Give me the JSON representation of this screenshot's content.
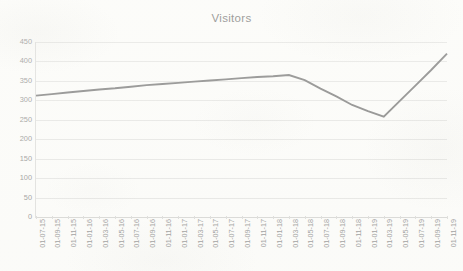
{
  "chart_data": {
    "type": "line",
    "title": "Visitors",
    "xlabel": "",
    "ylabel": "",
    "ylim": [
      0,
      450
    ],
    "yticks": [
      0,
      50,
      100,
      150,
      200,
      250,
      300,
      350,
      400,
      450
    ],
    "grid": true,
    "legend": false,
    "legend_position": "none",
    "line_color": "#737373",
    "categories": [
      "01-07-15",
      "01-09-15",
      "01-11-15",
      "01-01-16",
      "01-03-16",
      "01-05-16",
      "01-07-16",
      "01-09-16",
      "01-11-16",
      "01-01-17",
      "01-03-17",
      "01-05-17",
      "01-07-17",
      "01-09-17",
      "01-11-17",
      "01-01-18",
      "01-03-18",
      "01-05-18",
      "01-07-18",
      "01-09-18",
      "01-11-18",
      "01-01-19",
      "01-03-19",
      "01-05-19",
      "01-07-19",
      "01-09-19",
      "01-11-19"
    ],
    "values": [
      312,
      316,
      320,
      324,
      328,
      331,
      335,
      339,
      342,
      345,
      348,
      351,
      354,
      357,
      360,
      362,
      365,
      352,
      330,
      310,
      288,
      272,
      258,
      298,
      338,
      378,
      420
    ],
    "annotations": []
  },
  "colors": {
    "line": "#737373",
    "gridline": "#e4e4e2",
    "tick_label": "#8a8a8a",
    "title": "#6f6f6f",
    "background": "#fdfdfb"
  }
}
